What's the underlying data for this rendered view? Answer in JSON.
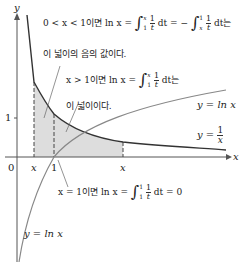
{
  "figure": {
    "axes": {
      "x_label": "x",
      "y_label": "y",
      "origin_label": "0",
      "y_tick_label": "1",
      "x_tick_one": "1",
      "x_left_label": "x",
      "x_right_label": "x"
    },
    "curves": [
      {
        "name": "y = 1/x",
        "label": "y =",
        "frac_num": "1",
        "frac_den": "x"
      },
      {
        "name": "y = ln x",
        "label_right": "y = ln x",
        "label_bottom": "y = ln x"
      }
    ],
    "annotations": {
      "case_lt1_prefix": "0 < x < 1이면  ln x =",
      "case_lt1_mid": "dt = −",
      "case_lt1_suffix": "dt는",
      "case_lt1_line2": "이 넓이의 음의 값이다.",
      "case_gt1_prefix": "x > 1이면  ln x =",
      "case_gt1_suffix": "dt는",
      "case_gt1_line2": "이 넓이이다.",
      "case_eq1_prefix": "x = 1이면  ln x =",
      "case_eq1_suffix": "dt = 0",
      "int_lower_1": "1",
      "int_upper_x": "x",
      "int_upper_1": "1",
      "int_lower_x": "x",
      "frac_num": "1",
      "frac_den": "t"
    },
    "colors": {
      "curve_recip": "#333333",
      "curve_ln": "#888888",
      "shade": "#dddddd",
      "axis": "#555555"
    }
  }
}
